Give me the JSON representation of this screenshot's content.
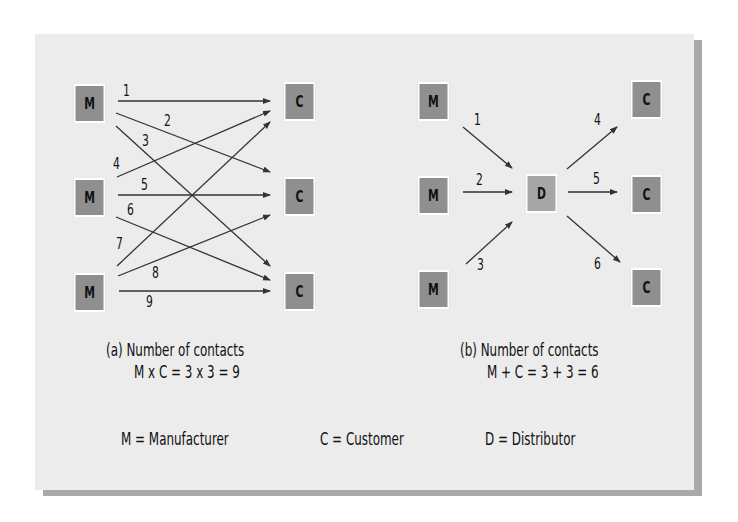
{
  "diagram": {
    "colors": {
      "background": "#ececec",
      "box_fill": "#8f8f8f",
      "distributor_fill": "#a6a6a6",
      "box_border": "#ffffff",
      "shadow": "#a9a9a9",
      "line": "#333333"
    },
    "panel_a": {
      "manufacturers": [
        "M",
        "M",
        "M"
      ],
      "customers": [
        "C",
        "C",
        "C"
      ],
      "contact_labels": [
        "1",
        "2",
        "3",
        "4",
        "5",
        "6",
        "7",
        "8",
        "9"
      ],
      "caption_title": "(a) Number of contacts",
      "caption_formula": "M x C = 3  x 3 = 9"
    },
    "panel_b": {
      "manufacturers": [
        "M",
        "M",
        "M"
      ],
      "distributor": "D",
      "customers": [
        "C",
        "C",
        "C"
      ],
      "contact_labels": [
        "1",
        "2",
        "3",
        "4",
        "5",
        "6"
      ],
      "caption_title": "(b) Number of contacts",
      "caption_formula": "M + C = 3  + 3 = 6"
    },
    "legend": {
      "manufacturer": "M  = Manufacturer",
      "customer": "C  = Customer",
      "distributor": "D  = Distributor"
    }
  }
}
